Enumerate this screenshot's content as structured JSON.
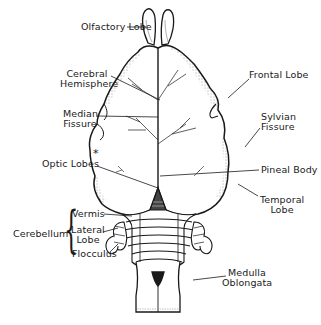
{
  "diagram": {
    "labels": {
      "olfactory_lobe": "Olfactory Lobe",
      "cerebral_hemisphere_1": "Cerebral",
      "cerebral_hemisphere_2": "Hemisphere",
      "frontal_lobe": "Frontal Lobe",
      "median_fissure_1": "Median",
      "median_fissure_2": "Fissure",
      "sylvian_fissure_1": "Sylvian",
      "sylvian_fissure_2": "Fissure",
      "optic_lobes": "Optic Lobes",
      "optic_lobes_marker": "*",
      "pineal_body": "Pineal Body",
      "temporal_lobe_1": "Temporal",
      "temporal_lobe_2": "Lobe",
      "cerebellum": "Cerebellum",
      "vermis": "Vermis",
      "lateral_lobe_1": "Lateral",
      "lateral_lobe_2": "Lobe",
      "flocculus": "Flocculus",
      "medulla_1": "Medulla",
      "medulla_2": "Oblongata"
    },
    "colors": {
      "ink": "#1a1a1a",
      "background": "#ffffff"
    }
  }
}
